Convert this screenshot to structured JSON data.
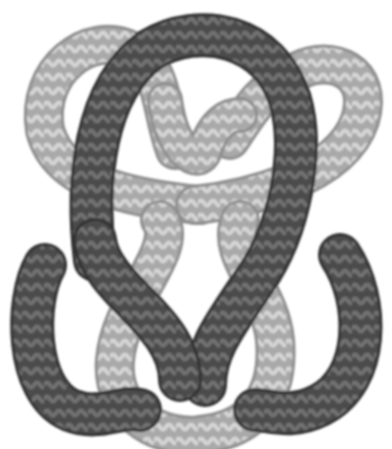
{
  "image": {
    "subject": "knot-illustration",
    "width": 392,
    "height": 449,
    "background": "#ffffff",
    "colors": {
      "light_strand": "#a8a8a8",
      "light_strand_pattern": "#d4d4d4",
      "light_strand_edge": "#8a8a8a",
      "dark_strand": "#4a4a4a",
      "dark_strand_pattern": "#6e6e6e",
      "dark_strand_edge": "#333333"
    }
  }
}
